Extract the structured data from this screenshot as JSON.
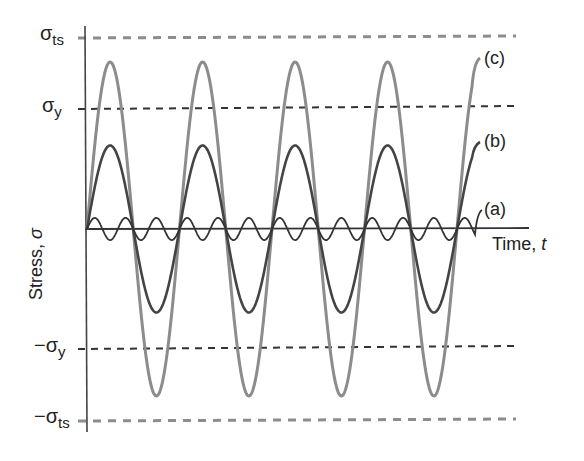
{
  "chart_data": {
    "type": "line",
    "title": "",
    "xlabel": "Time, t",
    "ylabel": "Stress, σ",
    "grid": false,
    "legend_position": "inline-right",
    "reference_lines": [
      {
        "name": "σts",
        "label": "σ",
        "sub": "ts",
        "value": 1.3,
        "style": "dashed",
        "color": "#888888"
      },
      {
        "name": "σy",
        "label": "σ",
        "sub": "y",
        "value": 0.75,
        "style": "dashed",
        "color": "#333333"
      },
      {
        "name": "-σy",
        "label": "−σ",
        "sub": "y",
        "value": -0.75,
        "style": "dashed",
        "color": "#333333"
      },
      {
        "name": "-σts",
        "label": "−σ",
        "sub": "ts",
        "value": -1.3,
        "style": "dashed",
        "color": "#888888"
      }
    ],
    "series": [
      {
        "name": "(a)",
        "description": "small amplitude, high frequency",
        "amplitude": 0.08,
        "cycles": 13,
        "color": "#333333"
      },
      {
        "name": "(b)",
        "description": "amplitude below yield stress",
        "amplitude": 0.6,
        "cycles": 4.25,
        "color": "#444444"
      },
      {
        "name": "(c)",
        "description": "amplitude above yield, below tensile strength",
        "amplitude": 1.2,
        "cycles": 4.25,
        "color": "#8c8c8c"
      }
    ]
  },
  "labels": {
    "sigma_ts": {
      "main": "σ",
      "sub": "ts"
    },
    "sigma_y": {
      "main": "σ",
      "sub": "y"
    },
    "neg_sigma_y": {
      "main": "−σ",
      "sub": "y"
    },
    "neg_sigma_ts": {
      "main": "−σ",
      "sub": "ts"
    },
    "curve_a": "(a)",
    "curve_b": "(b)",
    "curve_c": "(c)",
    "xlabel_text": "Time, ",
    "xlabel_var": "t",
    "ylabel_text": "Stress, ",
    "ylabel_var": "σ"
  }
}
